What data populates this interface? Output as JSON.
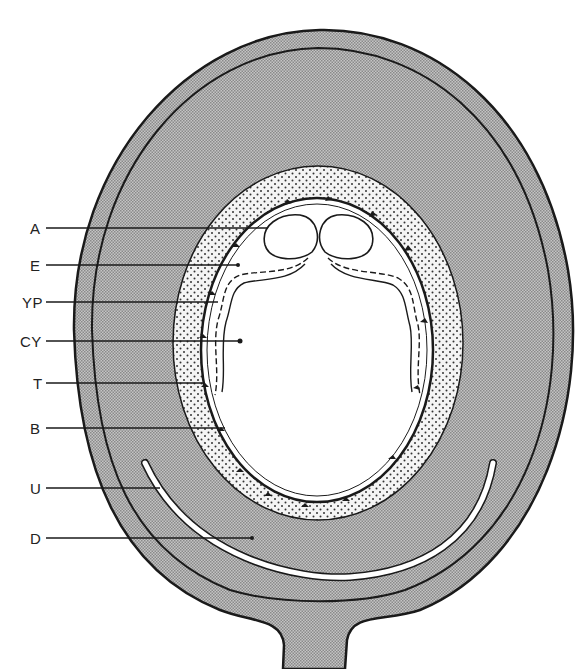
{
  "diagram": {
    "type": "labeled biological cross-section",
    "colors": {
      "ink": "#1a1a1a",
      "body_fill": "#a9a9a9",
      "ring_fill": "#f2f2f2",
      "cavity_fill": "#ffffff"
    },
    "labels": [
      {
        "id": "A",
        "text": "A",
        "y": 228,
        "end_x": 268
      },
      {
        "id": "E",
        "text": "E",
        "y": 265,
        "end_x": 238
      },
      {
        "id": "YP",
        "text": "YP",
        "y": 302,
        "end_x": 218
      },
      {
        "id": "CY",
        "text": "CY",
        "y": 341,
        "end_x": 240
      },
      {
        "id": "T",
        "text": "T",
        "y": 383,
        "end_x": 205
      },
      {
        "id": "B",
        "text": "B",
        "y": 428,
        "end_x": 225
      },
      {
        "id": "U",
        "text": "U",
        "y": 488,
        "end_x": 160
      },
      {
        "id": "D",
        "text": "D",
        "y": 538,
        "end_x": 252
      }
    ]
  }
}
